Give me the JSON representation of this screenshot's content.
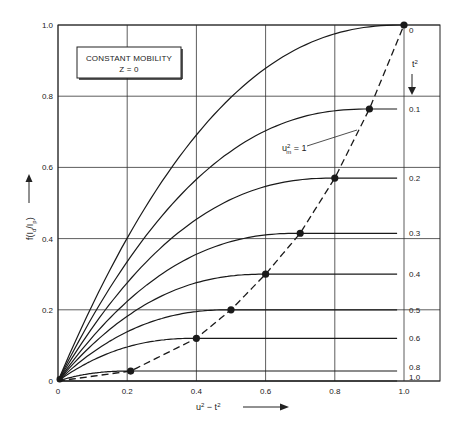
{
  "chart_data": {
    "type": "line",
    "title": "",
    "annotation_box": {
      "line1": "CONSTANT MOBILITY",
      "line2": "Z = 0"
    },
    "xlabel": "u² − t²",
    "ylabel": "f(I_d/I_p)",
    "xlim": [
      0,
      1.0
    ],
    "ylim": [
      0,
      1.0
    ],
    "x_ticks": [
      "0",
      "0.2",
      "0.4",
      "0.6",
      "0.8",
      "1.0"
    ],
    "y_ticks": [
      "0",
      "0.2",
      "0.4",
      "0.6",
      "0.8",
      "1.0"
    ],
    "grid": true,
    "parameter_label": "t²",
    "dashed_curve_label": "u_m² = 1",
    "series": [
      {
        "name": "t² = 0",
        "label": "0",
        "plateau": 1.0,
        "x_max": 1.0
      },
      {
        "name": "t² = 0.1",
        "label": "0.1",
        "plateau": 0.764,
        "x_max": 0.9
      },
      {
        "name": "t² = 0.2",
        "label": "0.2",
        "plateau": 0.57,
        "x_max": 0.8
      },
      {
        "name": "t² = 0.3",
        "label": "0.3",
        "plateau": 0.415,
        "x_max": 0.7
      },
      {
        "name": "t² = 0.4",
        "label": "0.4",
        "plateau": 0.3,
        "x_max": 0.6
      },
      {
        "name": "t² = 0.5",
        "label": "0.5",
        "plateau": 0.2,
        "x_max": 0.5
      },
      {
        "name": "t² = 0.6",
        "label": "0.6",
        "plateau": 0.12,
        "x_max": 0.4
      },
      {
        "name": "t² = 0.8",
        "label": "0.8",
        "plateau": 0.028,
        "x_max": 0.21
      },
      {
        "name": "t² = 1.0",
        "label": "1.0",
        "plateau": 0.0,
        "x_max": 0.0
      }
    ],
    "dashed_curve_points": [
      [
        0.0,
        0.0
      ],
      [
        0.21,
        0.028
      ],
      [
        0.4,
        0.12
      ],
      [
        0.5,
        0.2
      ],
      [
        0.6,
        0.3
      ],
      [
        0.7,
        0.415
      ],
      [
        0.8,
        0.57
      ],
      [
        0.9,
        0.764
      ],
      [
        1.0,
        1.0
      ]
    ],
    "legend_position": "none"
  }
}
